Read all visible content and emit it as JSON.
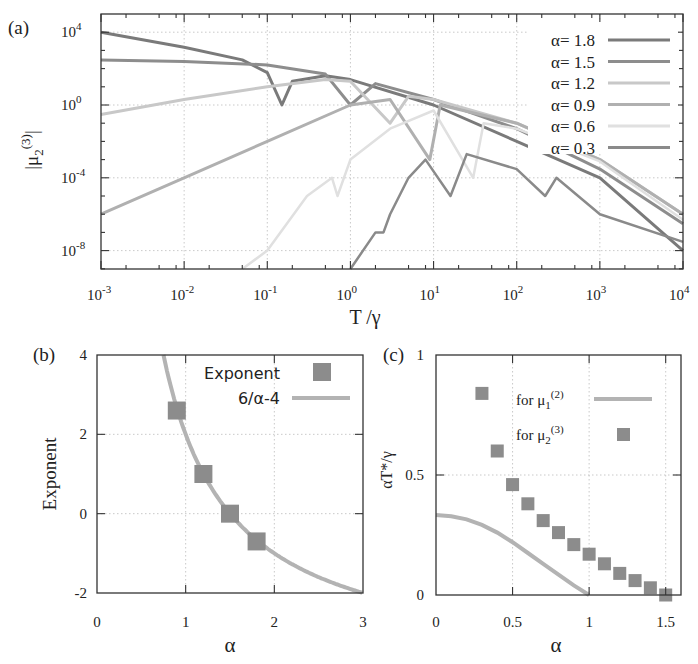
{
  "panels": {
    "a": {
      "label": "(a)"
    },
    "b": {
      "label": "(b)"
    },
    "c": {
      "label": "(c)"
    }
  },
  "chart_data": [
    {
      "panel": "(a)",
      "type": "line",
      "title": "",
      "xlabel": "T /γ",
      "ylabel": "|μ2(3)|",
      "xscale": "log",
      "yscale": "log",
      "xlim": [
        0.001,
        10000
      ],
      "ylim": [
        1e-10,
        100000.0
      ],
      "xticks": [
        "10^-3",
        "10^-2",
        "10^-1",
        "10^0",
        "10^1",
        "10^2",
        "10^3",
        "10^4"
      ],
      "yticks": [
        "10^-8",
        "10^-4",
        "10^0",
        "10^4"
      ],
      "grid": true,
      "legend_position": "upper right",
      "series": [
        {
          "name": "α= 1.8",
          "color": "#7a7a7a",
          "description": "decreasing power law from ~1e4 at T=1e-3, dip near T≈0.15, then merges with other curves and decays to ~1e-8 at T=1e4",
          "x": [
            0.001,
            0.01,
            0.05,
            0.1,
            0.15,
            0.2,
            0.5,
            1,
            10,
            100,
            1000,
            10000
          ],
          "y": [
            10000,
            1500,
            300,
            60,
            1,
            20,
            40,
            25,
            1,
            0.01,
            0.0001,
            1e-08
          ]
        },
        {
          "name": "α= 1.5",
          "color": "#8d8d8d",
          "description": "flat ~300 at low T, slight decrease, dip near T≈1, then power-law decay",
          "x": [
            0.001,
            0.01,
            0.1,
            0.5,
            1,
            2,
            10,
            100,
            1000,
            10000
          ],
          "y": [
            300,
            250,
            160,
            50,
            1,
            15,
            2,
            0.05,
            0.0003,
            3e-07
          ]
        },
        {
          "name": "α= 1.2",
          "color": "#c8c8c8",
          "description": "rising from ~0.3 at T=1e-3 to ~30 near T≈0.5, dip near T≈3, then decay",
          "x": [
            0.001,
            0.01,
            0.1,
            0.5,
            1,
            3,
            5,
            10,
            100,
            1000,
            10000
          ],
          "y": [
            0.3,
            2,
            10,
            25,
            20,
            0.1,
            3,
            2,
            0.1,
            0.001,
            1e-06
          ]
        },
        {
          "name": "α= 0.9",
          "color": "#b0b0b0",
          "description": "rising from ~1e-6 at T=1e-3 to ~1 near T=1, dip near T≈9, then decay",
          "x": [
            0.001,
            0.01,
            0.1,
            1,
            3,
            9,
            12,
            100,
            1000,
            10000
          ],
          "y": [
            1e-06,
            0.0001,
            0.01,
            1,
            2,
            0.001,
            1,
            0.1,
            0.001,
            1e-06
          ]
        },
        {
          "name": "α= 0.6",
          "color": "#e0e0e0",
          "description": "starts ~1e-10 near T=0.05, rises to ~1e-4 near T=0.6, dip near T≈0.7, rises to ~0.1, dip near T≈30, then decay",
          "x": [
            0.05,
            0.1,
            0.3,
            0.6,
            0.7,
            1,
            3,
            10,
            30,
            40,
            100,
            1000,
            10000
          ],
          "y": [
            1e-10,
            1e-08,
            1e-05,
            0.0001,
            1e-05,
            0.001,
            0.05,
            0.5,
            0.0001,
            0.1,
            0.05,
            0.0008,
            5e-07
          ]
        },
        {
          "name": "α= 0.3",
          "color": "#8a8a8a",
          "description": "starts ~1e-10 near T=1, rises with a kink near T≈2.5, peaks ~1e-3 near T≈8, dip near T≈16, dip near T≈220, then decay",
          "x": [
            1,
            2,
            2.5,
            3,
            5,
            8,
            16,
            25,
            100,
            220,
            300,
            1000,
            10000
          ],
          "y": [
            1e-10,
            1e-07,
            1e-07,
            1e-06,
            0.0001,
            0.001,
            1e-05,
            0.002,
            0.0003,
            1e-05,
            0.0001,
            1e-06,
            3e-08
          ]
        }
      ]
    },
    {
      "panel": "(b)",
      "type": "scatter",
      "title": "",
      "xlabel": "α",
      "ylabel": "Exponent",
      "xlim": [
        0,
        3
      ],
      "ylim": [
        -2,
        4
      ],
      "xticks": [
        "0",
        "1",
        "2",
        "3"
      ],
      "yticks": [
        "-2",
        "0",
        "2",
        "4"
      ],
      "grid": true,
      "legend_position": "upper right",
      "series": [
        {
          "name": "Exponent",
          "marker": "square",
          "color": "#8c8c8c",
          "x": [
            0.9,
            1.2,
            1.5,
            1.8
          ],
          "y": [
            2.6,
            1.0,
            0.0,
            -0.7
          ]
        },
        {
          "name": "6/α-4",
          "type": "line",
          "color": "#b3b3b3",
          "x": [
            0.75,
            0.8,
            0.9,
            1.0,
            1.2,
            1.5,
            1.8,
            2.0,
            2.5,
            3.0
          ],
          "y": [
            4.0,
            3.5,
            2.667,
            2.0,
            1.0,
            0.0,
            -0.667,
            -1.0,
            -1.6,
            -2.0
          ]
        }
      ]
    },
    {
      "panel": "(c)",
      "type": "scatter",
      "title": "",
      "xlabel": "α",
      "ylabel": "αT*/γ",
      "xlim": [
        0,
        1.6
      ],
      "ylim": [
        0,
        1
      ],
      "xticks": [
        "0",
        "0.5",
        "1",
        "1.5"
      ],
      "yticks": [
        "0",
        "0.5",
        "1"
      ],
      "grid": true,
      "legend_position": "upper right",
      "series": [
        {
          "name": "for μ1(2)",
          "type": "line",
          "color": "#b3b3b3",
          "x": [
            0,
            0.1,
            0.2,
            0.3,
            0.4,
            0.5,
            0.6,
            0.7,
            0.8,
            0.9,
            1.0
          ],
          "y": [
            0.333,
            0.328,
            0.315,
            0.292,
            0.26,
            0.22,
            0.175,
            0.13,
            0.085,
            0.04,
            0.0
          ]
        },
        {
          "name": "for μ2(3)",
          "marker": "square",
          "color": "#8c8c8c",
          "x": [
            0.3,
            0.4,
            0.5,
            0.6,
            0.7,
            0.8,
            0.9,
            1.0,
            1.1,
            1.2,
            1.3,
            1.4,
            1.5
          ],
          "y": [
            0.84,
            0.6,
            0.46,
            0.38,
            0.31,
            0.26,
            0.21,
            0.17,
            0.13,
            0.09,
            0.06,
            0.03,
            0.0
          ]
        }
      ]
    }
  ]
}
